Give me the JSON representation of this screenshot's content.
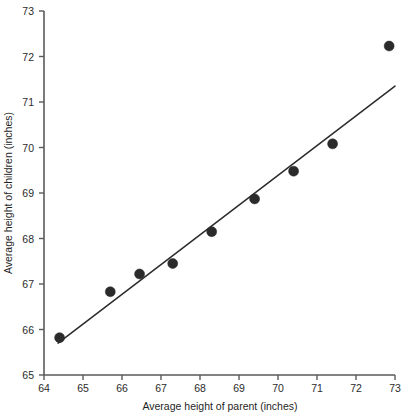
{
  "chart_data": {
    "type": "scatter",
    "title": "",
    "xlabel": "Average height of parent (inches)",
    "ylabel": "Average height of children (inches)",
    "xlim": [
      64,
      73
    ],
    "ylim": [
      65,
      73
    ],
    "xticks": [
      64,
      65,
      66,
      67,
      68,
      69,
      70,
      71,
      72,
      73
    ],
    "yticks": [
      65,
      66,
      67,
      68,
      69,
      70,
      71,
      72,
      73
    ],
    "xtick_labels": [
      "64",
      "65",
      "66",
      "67",
      "68",
      "69",
      "70",
      "71",
      "72",
      "73"
    ],
    "ytick_labels": [
      "65",
      "66",
      "67",
      "68",
      "69",
      "70",
      "71",
      "72",
      "73"
    ],
    "grid": false,
    "legend": null,
    "x": [
      64.4,
      65.7,
      66.45,
      67.3,
      68.3,
      69.4,
      70.4,
      71.4,
      72.85
    ],
    "y": [
      65.82,
      66.83,
      67.22,
      67.45,
      68.15,
      68.87,
      69.48,
      70.08,
      72.23
    ],
    "series": [
      {
        "name": "children vs parent height",
        "type": "scatter",
        "marker": "filled-circle",
        "marker_color": "#2b2b2b",
        "marker_size": 6.6,
        "points": [
          {
            "x": 64.4,
            "y": 65.82
          },
          {
            "x": 65.7,
            "y": 66.83
          },
          {
            "x": 66.45,
            "y": 67.22
          },
          {
            "x": 67.3,
            "y": 67.45
          },
          {
            "x": 68.3,
            "y": 68.15
          },
          {
            "x": 69.4,
            "y": 68.87
          },
          {
            "x": 70.4,
            "y": 69.48
          },
          {
            "x": 71.4,
            "y": 70.08
          },
          {
            "x": 72.85,
            "y": 72.23
          }
        ]
      },
      {
        "name": "regression line",
        "type": "line",
        "line_color": "#2b2b2b",
        "line_width": 1.5,
        "endpoints": [
          {
            "x": 64.36,
            "y": 65.7
          },
          {
            "x": 73.0,
            "y": 71.35
          }
        ]
      }
    ],
    "annotations": [],
    "axis_color": "#5a5a5a",
    "background": "#ffffff"
  },
  "figure": {
    "plot_left_px": 44,
    "plot_right_px": 395,
    "plot_top_px": 11,
    "plot_bottom_px": 375
  }
}
